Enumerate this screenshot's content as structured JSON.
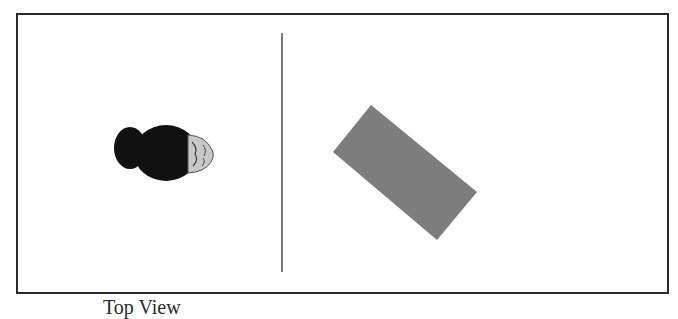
{
  "figure": {
    "caption": "Top View",
    "panels": [
      {
        "id": "left",
        "content": "person-head-top-view",
        "description": "Top-down view of a person's head with a hair bun, facing right"
      },
      {
        "id": "right",
        "content": "rotated-rectangle",
        "description": "Grey rectangle rotated about 45 degrees"
      }
    ],
    "colors": {
      "border": "#2b2b2b",
      "divider": "#7a7a7a",
      "hair": "#111111",
      "face": "#c8c8c8",
      "rectangle": "#7d7d7d"
    }
  }
}
